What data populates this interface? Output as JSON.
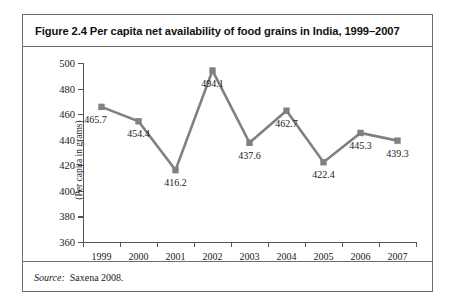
{
  "figure": {
    "title": "Figure 2.4 Per capita net availability of food grains in India, 1999–2007",
    "source_label": "Source:",
    "source_value": "Saxena 2008."
  },
  "style": {
    "series_color": "#808080",
    "axis_color": "#555555",
    "border_color": "#6e6e6e",
    "text_color": "#1a1a1a"
  },
  "chart_data": {
    "type": "line",
    "title": "Figure 2.4 Per capita net availability of food grains in India, 1999–2007",
    "xlabel": "",
    "ylabel": "(Per capita in grams)",
    "categories": [
      "1999",
      "2000",
      "2001",
      "2002",
      "2003",
      "2004",
      "2005",
      "2006",
      "2007"
    ],
    "values": [
      465.7,
      454.4,
      416.2,
      494.1,
      437.6,
      462.7,
      422.4,
      445.3,
      439.3
    ],
    "point_labels": [
      "465.7",
      "454.4",
      "416.2",
      "494.1",
      "437.6",
      "462.7",
      "422.4",
      "445.3",
      "439.3"
    ],
    "label_positions": [
      "below-left",
      "below",
      "below",
      "below",
      "below",
      "below",
      "below",
      "below",
      "below"
    ],
    "ylim": [
      360,
      500
    ],
    "yticks": [
      360,
      380,
      400,
      420,
      440,
      460,
      480,
      500
    ],
    "ytick_labels": [
      "360",
      "380",
      "400",
      "420",
      "440",
      "460",
      "480",
      "500"
    ],
    "grid": false,
    "legend": "none",
    "marker": "square",
    "series": [
      {
        "name": "Per capita net availability of food grains",
        "values": [
          465.7,
          454.4,
          416.2,
          494.1,
          437.6,
          462.7,
          422.4,
          445.3,
          439.3
        ]
      }
    ]
  }
}
